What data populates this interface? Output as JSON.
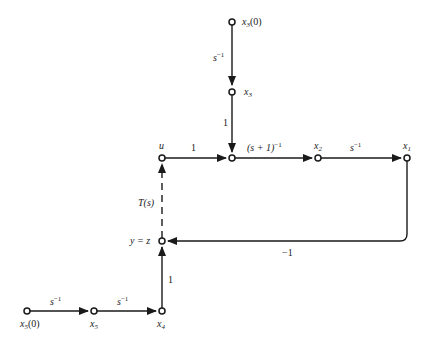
{
  "diagram": {
    "type": "signal-flow-graph",
    "nodes": {
      "x3_0": {
        "label": "x",
        "sub": "3",
        "suffix": "(0)"
      },
      "x3": {
        "label": "x",
        "sub": "3"
      },
      "junction": {
        "label": ""
      },
      "u": {
        "label": "u"
      },
      "x2": {
        "label": "x",
        "sub": "2"
      },
      "x1": {
        "label": "x",
        "sub": "1"
      },
      "yz": {
        "label": "y = z"
      },
      "x4": {
        "label": "x",
        "sub": "4"
      },
      "x5": {
        "label": "x",
        "sub": "5"
      },
      "x5_0": {
        "label": "x",
        "sub": "5",
        "suffix": "(0)"
      }
    },
    "edges": {
      "x3_0_to_x3": {
        "gain": "s",
        "exp": "−1"
      },
      "x3_to_junction": {
        "gain": "1"
      },
      "u_to_junction": {
        "gain": "1"
      },
      "junction_to_x2": {
        "gain": "(s + 1)",
        "exp": "−1"
      },
      "x2_to_x1": {
        "gain": "s",
        "exp": "−1"
      },
      "x1_to_yz": {
        "gain": "−1"
      },
      "yz_to_u": {
        "gain": "T(s)",
        "style": "dashed"
      },
      "x4_to_yz": {
        "gain": "1"
      },
      "x5_to_x4": {
        "gain": "s",
        "exp": "−1"
      },
      "x5_0_to_x5": {
        "gain": "s",
        "exp": "−1"
      }
    }
  }
}
